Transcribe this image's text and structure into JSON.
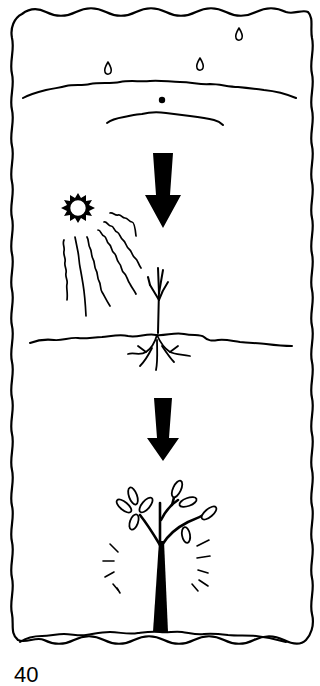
{
  "diagram": {
    "panels": [
      {
        "step": 1,
        "label": "rain-on-soil-with-seed",
        "elements": [
          "raindrop",
          "raindrop",
          "raindrop",
          "ground-line",
          "seed",
          "soil-mound"
        ]
      },
      {
        "step": 2,
        "label": "sun-shining-on-sprout",
        "elements": [
          "sun",
          "sun-rays",
          "sprout",
          "roots",
          "ground-line"
        ]
      },
      {
        "step": 3,
        "label": "grown-tree",
        "elements": [
          "tree",
          "leaves",
          "growth-lines",
          "ground-line"
        ]
      }
    ],
    "arrows": [
      {
        "direction": "down",
        "between": [
          1,
          2
        ]
      },
      {
        "direction": "down",
        "between": [
          2,
          3
        ]
      }
    ]
  },
  "page": {
    "number": "40"
  }
}
